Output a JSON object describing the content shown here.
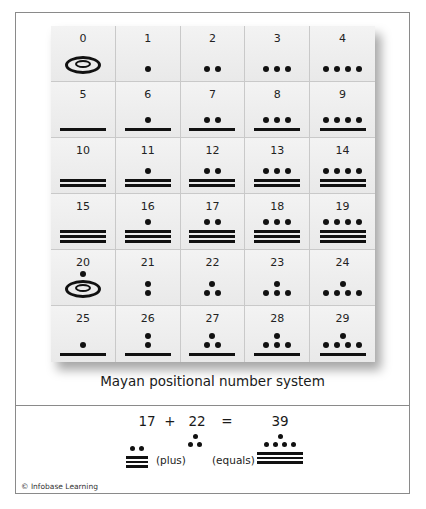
{
  "caption": "Mayan positional number system",
  "table": {
    "cells": [
      {
        "n": "0",
        "dots_top": 0,
        "dots": 0,
        "bars": 0,
        "shell": true
      },
      {
        "n": "1",
        "dots_top": 0,
        "dots": 1,
        "bars": 0,
        "shell": false
      },
      {
        "n": "2",
        "dots_top": 0,
        "dots": 2,
        "bars": 0,
        "shell": false
      },
      {
        "n": "3",
        "dots_top": 0,
        "dots": 3,
        "bars": 0,
        "shell": false
      },
      {
        "n": "4",
        "dots_top": 0,
        "dots": 4,
        "bars": 0,
        "shell": false
      },
      {
        "n": "5",
        "dots_top": 0,
        "dots": 0,
        "bars": 1,
        "shell": false
      },
      {
        "n": "6",
        "dots_top": 0,
        "dots": 1,
        "bars": 1,
        "shell": false
      },
      {
        "n": "7",
        "dots_top": 0,
        "dots": 2,
        "bars": 1,
        "shell": false
      },
      {
        "n": "8",
        "dots_top": 0,
        "dots": 3,
        "bars": 1,
        "shell": false
      },
      {
        "n": "9",
        "dots_top": 0,
        "dots": 4,
        "bars": 1,
        "shell": false
      },
      {
        "n": "10",
        "dots_top": 0,
        "dots": 0,
        "bars": 2,
        "shell": false
      },
      {
        "n": "11",
        "dots_top": 0,
        "dots": 1,
        "bars": 2,
        "shell": false
      },
      {
        "n": "12",
        "dots_top": 0,
        "dots": 2,
        "bars": 2,
        "shell": false
      },
      {
        "n": "13",
        "dots_top": 0,
        "dots": 3,
        "bars": 2,
        "shell": false
      },
      {
        "n": "14",
        "dots_top": 0,
        "dots": 4,
        "bars": 2,
        "shell": false
      },
      {
        "n": "15",
        "dots_top": 0,
        "dots": 0,
        "bars": 3,
        "shell": false
      },
      {
        "n": "16",
        "dots_top": 0,
        "dots": 1,
        "bars": 3,
        "shell": false
      },
      {
        "n": "17",
        "dots_top": 0,
        "dots": 2,
        "bars": 3,
        "shell": false
      },
      {
        "n": "18",
        "dots_top": 0,
        "dots": 3,
        "bars": 3,
        "shell": false
      },
      {
        "n": "19",
        "dots_top": 0,
        "dots": 4,
        "bars": 3,
        "shell": false
      },
      {
        "n": "20",
        "dots_top": 1,
        "dots": 0,
        "bars": 0,
        "shell": true
      },
      {
        "n": "21",
        "dots_top": 1,
        "dots": 1,
        "bars": 0,
        "shell": false
      },
      {
        "n": "22",
        "dots_top": 1,
        "dots": 2,
        "bars": 0,
        "shell": false
      },
      {
        "n": "23",
        "dots_top": 1,
        "dots": 3,
        "bars": 0,
        "shell": false
      },
      {
        "n": "24",
        "dots_top": 1,
        "dots": 4,
        "bars": 0,
        "shell": false
      },
      {
        "n": "25",
        "dots_top": 1,
        "dots": 0,
        "bars": 1,
        "shell": false
      },
      {
        "n": "26",
        "dots_top": 1,
        "dots": 1,
        "bars": 1,
        "shell": false
      },
      {
        "n": "27",
        "dots_top": 1,
        "dots": 2,
        "bars": 1,
        "shell": false
      },
      {
        "n": "28",
        "dots_top": 1,
        "dots": 3,
        "bars": 1,
        "shell": false
      },
      {
        "n": "29",
        "dots_top": 1,
        "dots": 4,
        "bars": 1,
        "shell": false
      }
    ]
  },
  "equation": {
    "a": "17",
    "plus_sign": "+",
    "b": "22",
    "equals_sign": "=",
    "result": "39",
    "plus_word": "(plus)",
    "equals_word": "(equals)"
  },
  "credit": "© Infobase Learning"
}
